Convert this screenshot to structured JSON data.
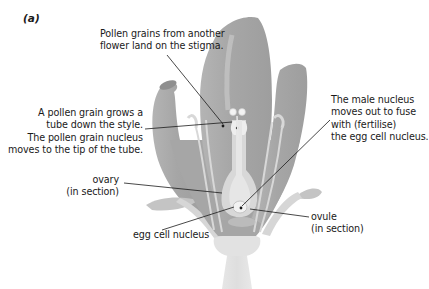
{
  "figure": {
    "panel_label": "(a)",
    "colors": {
      "petal": "#a9a9a9",
      "petal_light": "#c9c9c9",
      "tissue_light": "#dcdcdc",
      "leader_line": "#1a1a1a",
      "text": "#1a1a1a",
      "background": "#ffffff"
    }
  },
  "annotations": {
    "pollen_stigma": {
      "lines": [
        "Pollen grains from another",
        "flower land on the stigma."
      ]
    },
    "pollen_tube": {
      "lines": [
        "A pollen grain grows a",
        "tube down the style.",
        "The pollen grain nucleus",
        "moves to the tip of the tube."
      ]
    },
    "male_nucleus": {
      "lines": [
        "The male nucleus",
        "moves out to fuse",
        "with (fertilise)",
        "the egg cell nucleus."
      ]
    },
    "ovary": {
      "lines": [
        "ovary",
        "(in section)"
      ]
    },
    "egg_cell": {
      "lines": [
        "egg cell nucleus"
      ]
    },
    "ovule": {
      "lines": [
        "ovule",
        "(in section)"
      ]
    }
  }
}
